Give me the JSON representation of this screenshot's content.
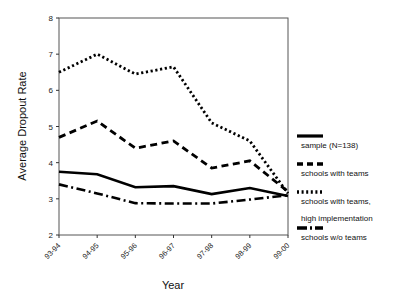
{
  "chart_data": {
    "type": "line",
    "title": "",
    "xlabel": "Year",
    "ylabel": "Average Dropout Rate",
    "categories": [
      "93-94",
      "94-95",
      "95-96",
      "96-97",
      "97-98",
      "98-99",
      "99-00"
    ],
    "ylim": [
      2,
      8
    ],
    "yticks": [
      2,
      3,
      4,
      5,
      6,
      7,
      8
    ],
    "grid": false,
    "legend_position": "right",
    "series": [
      {
        "name": "sample (N=138)",
        "style": "solid",
        "values": [
          3.75,
          3.68,
          3.32,
          3.35,
          3.13,
          3.3,
          3.08
        ]
      },
      {
        "name": "schools with teams",
        "style": "dashed",
        "values": [
          4.7,
          5.15,
          4.4,
          4.6,
          3.85,
          4.05,
          3.2
        ]
      },
      {
        "name": "schools with teams, high implementation",
        "style": "dotted",
        "values": [
          6.5,
          7.0,
          6.45,
          6.65,
          5.1,
          4.6,
          3.15
        ]
      },
      {
        "name": "schools w/o teams",
        "style": "dash-dot",
        "values": [
          3.4,
          3.15,
          2.88,
          2.87,
          2.87,
          2.98,
          3.1
        ]
      }
    ]
  },
  "legend": {
    "entries": [
      {
        "label": "sample (N=138)",
        "style": "solid"
      },
      {
        "label": "schools with teams",
        "style": "dashed"
      },
      {
        "label": "schools with teams,",
        "style": "dotted"
      },
      {
        "label": "high implementation",
        "style": "none"
      },
      {
        "label": "schools w/o teams",
        "style": "dash-dot"
      }
    ]
  },
  "axes": {
    "y_label": "Average Dropout Rate",
    "x_label": "Year",
    "y_tick_labels": [
      "2",
      "3",
      "4",
      "5",
      "6",
      "7",
      "8"
    ],
    "x_tick_labels": [
      "93-94",
      "94-95",
      "95-96",
      "96-97",
      "97-98",
      "98-99",
      "99-00"
    ]
  }
}
